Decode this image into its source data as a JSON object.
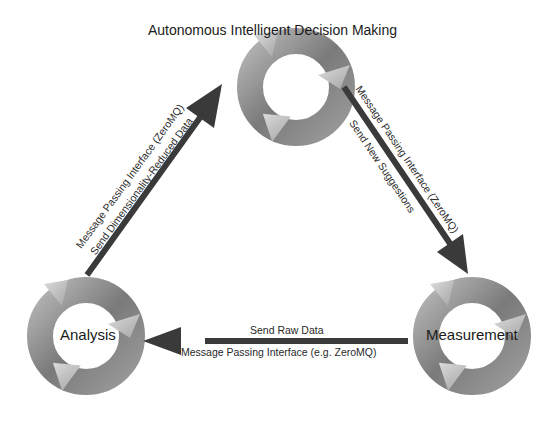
{
  "diagram": {
    "type": "cycle-triangle",
    "nodes": [
      {
        "id": "decision",
        "label": "Autonomous Intelligent Decision Making",
        "icon": "cycle-arrows-icon"
      },
      {
        "id": "analysis",
        "label": "Analysis",
        "icon": "cycle-arrows-icon"
      },
      {
        "id": "measurement",
        "label": "Measurement",
        "icon": "cycle-arrows-icon"
      }
    ],
    "edges": [
      {
        "from": "analysis",
        "to": "decision",
        "label_top": "Message Passing Interface (ZeroMQ)",
        "label_bottom": "Send Dimensionality-Reduced Data"
      },
      {
        "from": "decision",
        "to": "measurement",
        "label_top": "Message Passing Interface (ZeroMQ)",
        "label_bottom": "Send New Suggestions"
      },
      {
        "from": "measurement",
        "to": "analysis",
        "label_top": "Send Raw Data",
        "label_bottom": "Message Passing Interface (e.g. ZeroMQ)"
      }
    ],
    "colors": {
      "arrow": "#3a3a3a",
      "ring_dark": "#6e6e6e",
      "ring_light": "#c8c8c8",
      "background": "#ffffff"
    }
  }
}
